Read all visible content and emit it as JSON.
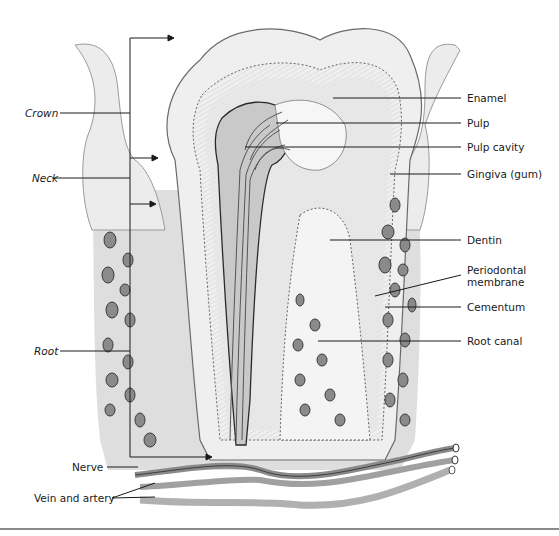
{
  "figure": {
    "left_labels": {
      "crown": "Crown",
      "neck": "Neck",
      "root": "Root"
    },
    "right_labels": {
      "enamel": "Enamel",
      "pulp": "Pulp",
      "pulp_cavity": "Pulp cavity",
      "gingiva": "Gingiva (gum)",
      "dentin": "Dentin",
      "periodontal_line1": "Periodontal",
      "periodontal_line2": "membrane",
      "cementum": "Cementum",
      "root_canal": "Root canal"
    },
    "bottom_labels": {
      "nerve": "Nerve",
      "vein_artery": "Vein and artery"
    },
    "colors": {
      "background": "#ffffff",
      "line": "#1a1a1a",
      "enamel": "#f2f2f2",
      "dentin": "#e2e2e2",
      "bone": "#dcdcdc",
      "gum": "#e9e9e9",
      "vessel": "#9a9a9a",
      "bone_cell": "#6a6a6a"
    }
  }
}
